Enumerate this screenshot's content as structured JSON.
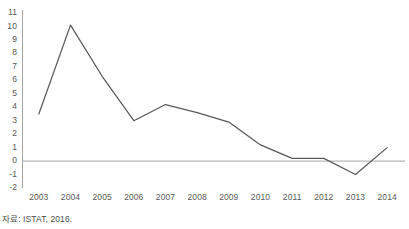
{
  "caption": "자료: ISTAT, 2016.",
  "colors": {
    "line": "#595959",
    "axis": "#a6a6a6",
    "zero_line": "#a6a6a6",
    "tick_text": "#5a5a5a",
    "background": "#ffffff"
  },
  "chart_data": {
    "type": "line",
    "title": "",
    "xlabel": "",
    "ylabel": "",
    "categories": [
      "2003",
      "2004",
      "2005",
      "2006",
      "2007",
      "2008",
      "2009",
      "2010",
      "2011",
      "2012",
      "2013",
      "2014"
    ],
    "values": [
      3.5,
      10.1,
      6.3,
      3.0,
      4.2,
      3.6,
      2.9,
      1.2,
      0.2,
      0.2,
      -1.0,
      1.0
    ],
    "series": [
      {
        "name": "",
        "values": [
          3.5,
          10.1,
          6.3,
          3.0,
          4.2,
          3.6,
          2.9,
          1.2,
          0.2,
          0.2,
          -1.0,
          1.0
        ]
      }
    ],
    "ylim": [
      -2,
      11
    ],
    "yticks": [
      11,
      10,
      9,
      8,
      7,
      6,
      5,
      4,
      3,
      2,
      1,
      0,
      -1,
      -2
    ],
    "ytick_labels": [
      "11",
      "10",
      "9",
      "8",
      "7",
      "6",
      "5",
      "4",
      "3",
      "2",
      "1",
      "0",
      "-1",
      "-2"
    ],
    "xticks": [
      "2003",
      "2004",
      "2005",
      "2006",
      "2007",
      "2008",
      "2009",
      "2010",
      "2011",
      "2012",
      "2013",
      "2014"
    ],
    "grid": false,
    "legend": "none",
    "zero_reference_line": 0
  }
}
